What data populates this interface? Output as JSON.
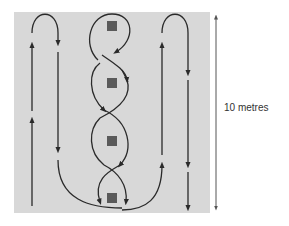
{
  "diagram": {
    "dimension_label": "10 metres",
    "colors": {
      "field": "#d8d8d8",
      "path": "#2a2a2a",
      "marker": "#5a5a5a",
      "dimension": "#555555",
      "background": "#ffffff"
    },
    "markers": [
      {
        "id": "cone-1",
        "x": 112,
        "y": 26
      },
      {
        "id": "cone-2",
        "x": 112,
        "y": 83
      },
      {
        "id": "cone-3",
        "x": 112,
        "y": 141
      },
      {
        "id": "cone-4",
        "x": 112,
        "y": 198
      }
    ],
    "paths": [
      {
        "name": "left-loop",
        "description": "Up the left line, loop over the top, down the second line, sweeping to the centre bottom"
      },
      {
        "name": "centre-weave",
        "description": "Figure-of-eight weave through four cones"
      },
      {
        "name": "right-loop",
        "description": "Up the right inner line, loop over the top, down the right outer line"
      }
    ]
  }
}
